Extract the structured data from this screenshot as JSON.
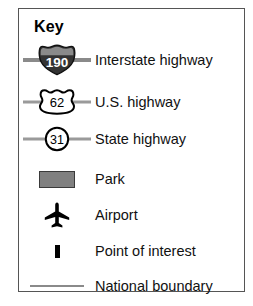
{
  "panel": {
    "title": "Key",
    "border_color": "#555555",
    "background": "#ffffff"
  },
  "colors": {
    "interstate_shield_fill": "#333333",
    "interstate_shield_top_band": "#8a8a8a",
    "interstate_number_color": "#ffffff",
    "road_stub_gray": "#8a8a8a",
    "park_fill": "#808080",
    "park_border": "#3a3a3a",
    "marker_black": "#000000",
    "boundary_gray": "#8a8a8a",
    "text_color": "#111111"
  },
  "entries": [
    {
      "symbol": "interstate-shield",
      "number": "190",
      "label": "Interstate highway"
    },
    {
      "symbol": "us-highway-shield",
      "number": "62",
      "label": "U.S. highway"
    },
    {
      "symbol": "state-highway-circle",
      "number": "31",
      "label": "State highway"
    },
    {
      "symbol": "park-swatch",
      "number": "",
      "label": "Park"
    },
    {
      "symbol": "airplane-icon",
      "number": "",
      "label": "Airport"
    },
    {
      "symbol": "point-of-interest-marker",
      "number": "",
      "label": "Point of interest"
    },
    {
      "symbol": "boundary-line",
      "number": "",
      "label": "National boundary"
    }
  ]
}
